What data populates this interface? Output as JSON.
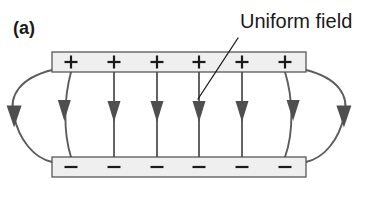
{
  "figure": {
    "panel_label": "(a)",
    "annotation": "Uniform field",
    "colors": {
      "plate_fill": "#efefef",
      "plate_stroke": "#4a4a4a",
      "field_line": "#5c5c5c",
      "arrow_head": "#4f4f4f",
      "text": "#1a1a1a",
      "background": "#ffffff"
    }
  },
  "plates": {
    "top": {
      "polarity": "+",
      "charge_count": 6,
      "charges": [
        "+",
        "+",
        "+",
        "+",
        "+",
        "+"
      ],
      "x_left": 52,
      "x_right": 306,
      "y_top": 52,
      "y_bottom": 72
    },
    "bottom": {
      "polarity": "-",
      "charge_count": 6,
      "charges": [
        "−",
        "−",
        "−",
        "−",
        "−",
        "−"
      ],
      "x_left": 52,
      "x_right": 306,
      "y_top": 157,
      "y_bottom": 177
    },
    "charge_x_positions": [
      71,
      114,
      157,
      199,
      242,
      285
    ]
  },
  "field": {
    "interior_line_count": 6,
    "fringe_line_count": 2,
    "direction": "downward, from positive plate to negative plate",
    "arrow_y": 113,
    "leader": {
      "from_x": 238,
      "from_y": 38,
      "to_x": 198,
      "to_y": 99
    }
  }
}
